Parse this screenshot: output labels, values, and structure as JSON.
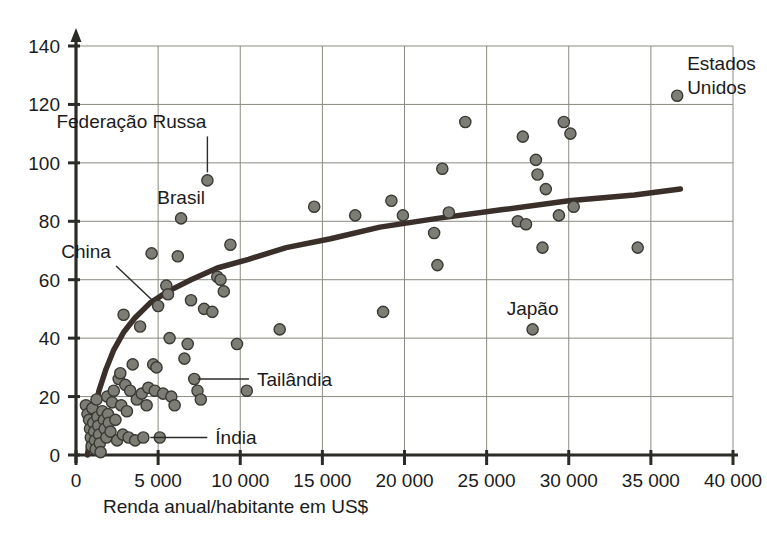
{
  "chart_data": {
    "type": "scatter",
    "title": "",
    "subtitle": "",
    "xlabel": "Renda anual/habitante em US$",
    "ylabel": "",
    "xlim": [
      0,
      40000
    ],
    "ylim": [
      0,
      140
    ],
    "grid": true,
    "legend": "none",
    "x_ticks": [
      "0",
      "5 000",
      "10 000",
      "15 000",
      "20 000",
      "25 000",
      "30 000",
      "35 000",
      "40 000"
    ],
    "x_tick_values": [
      0,
      5000,
      10000,
      15000,
      20000,
      25000,
      30000,
      35000,
      40000
    ],
    "y_ticks": [
      "0",
      "20",
      "40",
      "60",
      "80",
      "100",
      "120",
      "140"
    ],
    "y_tick_values": [
      0,
      20,
      40,
      60,
      80,
      100,
      120,
      140
    ],
    "point_color": "#7d7d76",
    "point_edge_color": "#3a3a35",
    "trend_color": "#3b2f2a",
    "grid_color": "#8a8a82",
    "axis_color": "#2b2b28",
    "series": [
      {
        "name": "Países",
        "points": [
          [
            600,
            17
          ],
          [
            700,
            14
          ],
          [
            800,
            12
          ],
          [
            850,
            9
          ],
          [
            900,
            6
          ],
          [
            950,
            3
          ],
          [
            1000,
            16
          ],
          [
            1050,
            11
          ],
          [
            1100,
            8
          ],
          [
            1150,
            5
          ],
          [
            1200,
            2
          ],
          [
            1250,
            19
          ],
          [
            1300,
            13
          ],
          [
            1350,
            10
          ],
          [
            1400,
            7
          ],
          [
            1450,
            4
          ],
          [
            1500,
            1
          ],
          [
            1600,
            15
          ],
          [
            1700,
            12
          ],
          [
            1750,
            9
          ],
          [
            1850,
            6
          ],
          [
            1900,
            20
          ],
          [
            1950,
            14
          ],
          [
            2000,
            11
          ],
          [
            2100,
            8
          ],
          [
            2200,
            18
          ],
          [
            2300,
            22
          ],
          [
            2400,
            12
          ],
          [
            2500,
            5
          ],
          [
            2600,
            26
          ],
          [
            2700,
            28
          ],
          [
            2750,
            17
          ],
          [
            2850,
            7
          ],
          [
            2900,
            48
          ],
          [
            3000,
            24
          ],
          [
            3100,
            15
          ],
          [
            3200,
            6
          ],
          [
            3300,
            22
          ],
          [
            3450,
            31
          ],
          [
            3600,
            5
          ],
          [
            3700,
            19
          ],
          [
            3900,
            44
          ],
          [
            4000,
            21
          ],
          [
            4100,
            6
          ],
          [
            4300,
            17
          ],
          [
            4400,
            23
          ],
          [
            4600,
            69
          ],
          [
            4700,
            31
          ],
          [
            4800,
            22
          ],
          [
            4900,
            30
          ],
          [
            5000,
            51
          ],
          [
            5100,
            6
          ],
          [
            5300,
            21
          ],
          [
            5500,
            58
          ],
          [
            5600,
            55
          ],
          [
            5700,
            40
          ],
          [
            5800,
            20
          ],
          [
            6000,
            17
          ],
          [
            6200,
            68
          ],
          [
            6400,
            81
          ],
          [
            6600,
            33
          ],
          [
            6800,
            38
          ],
          [
            7000,
            53
          ],
          [
            7200,
            26
          ],
          [
            7400,
            22
          ],
          [
            7600,
            19
          ],
          [
            7800,
            50
          ],
          [
            8000,
            94
          ],
          [
            8300,
            49
          ],
          [
            8600,
            61
          ],
          [
            8800,
            60
          ],
          [
            9000,
            56
          ],
          [
            9400,
            72
          ],
          [
            9800,
            38
          ],
          [
            10400,
            22
          ],
          [
            12400,
            43
          ],
          [
            14500,
            85
          ],
          [
            17000,
            82
          ],
          [
            18700,
            49
          ],
          [
            19200,
            87
          ],
          [
            19900,
            82
          ],
          [
            21800,
            76
          ],
          [
            22000,
            65
          ],
          [
            22300,
            98
          ],
          [
            22700,
            83
          ],
          [
            23700,
            114
          ],
          [
            26900,
            80
          ],
          [
            27200,
            109
          ],
          [
            27400,
            79
          ],
          [
            27800,
            43
          ],
          [
            28000,
            101
          ],
          [
            28100,
            96
          ],
          [
            28400,
            71
          ],
          [
            28600,
            91
          ],
          [
            29400,
            82
          ],
          [
            29700,
            114
          ],
          [
            30100,
            110
          ],
          [
            30300,
            85
          ],
          [
            34200,
            71
          ],
          [
            36600,
            123
          ]
        ]
      }
    ],
    "trend_line": {
      "description": "logarithmic fit curve",
      "points": [
        [
          700,
          0
        ],
        [
          900,
          8
        ],
        [
          1100,
          15
        ],
        [
          1400,
          22
        ],
        [
          1800,
          29
        ],
        [
          2300,
          36
        ],
        [
          2900,
          42
        ],
        [
          3600,
          47
        ],
        [
          4500,
          52
        ],
        [
          5600,
          56
        ],
        [
          7000,
          60
        ],
        [
          8600,
          64
        ],
        [
          10500,
          67
        ],
        [
          12800,
          71
        ],
        [
          15500,
          74
        ],
        [
          18500,
          78
        ],
        [
          22000,
          81
        ],
        [
          26000,
          84
        ],
        [
          30000,
          87
        ],
        [
          34000,
          89
        ],
        [
          36800,
          91
        ]
      ]
    },
    "annotations": [
      {
        "label": "Estados\nUnidos",
        "lines": [
          "Estados",
          "Unidos"
        ],
        "x": 36600,
        "y": 123,
        "style": "right-of-point"
      },
      {
        "label": "Federação Russa",
        "lines": [
          "Federação Russa"
        ],
        "x": 8000,
        "y": 94,
        "style": "vertical-leader"
      },
      {
        "label": "Brasil",
        "lines": [
          "Brasil"
        ],
        "x": 6400,
        "y": 81,
        "style": "above-point"
      },
      {
        "label": "China",
        "lines": [
          "China"
        ],
        "x": 5000,
        "y": 51,
        "style": "diagonal-leader"
      },
      {
        "label": "Tailândia",
        "lines": [
          "Tailândia"
        ],
        "x": 7000,
        "y": 26,
        "style": "horizontal-leader"
      },
      {
        "label": "Índia",
        "lines": [
          "Índia"
        ],
        "x": 4100,
        "y": 6,
        "style": "horizontal-leader"
      },
      {
        "label": "Japão",
        "lines": [
          "Japão"
        ],
        "x": 27800,
        "y": 43,
        "style": "above-point"
      }
    ]
  },
  "axis": {
    "x_title": "Renda anual/habitante em US$"
  }
}
